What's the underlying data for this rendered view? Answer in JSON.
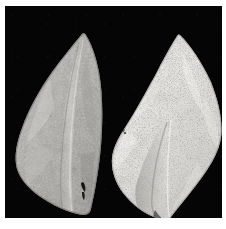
{
  "figure": {
    "kind": "photographic-plate",
    "background_color": "#050505",
    "border_color": "#ffffff",
    "plate": {
      "left": 5,
      "top": 6,
      "width": 217,
      "height": 212
    }
  },
  "artifacts": [
    {
      "id": "left-biface",
      "name": "Left biface",
      "position": "left",
      "shape": "leaf-shaped / ovate-lanceolate point",
      "orientation": "tip up, base down",
      "surface_tone": "medium gray",
      "base_color": "#a9a7a2",
      "highlight_color": "#cfcdc8",
      "shadow_color": "#6f6d6a",
      "texture": "mottled, coarse flake-scar relief with scattered dark pits",
      "tip_point": "77,38",
      "base_point": "78,210",
      "widest_point": "14,150",
      "features": [
        "longitudinal median ridge running from tip to base",
        "small dark notch near lower right margin",
        "rounded shoulder on upper left edge"
      ]
    },
    {
      "id": "right-biface",
      "name": "Right biface",
      "position": "right",
      "shape": "leaf-shaped / ovate-lanceolate point",
      "orientation": "tip up, base down",
      "surface_tone": "light, near-white",
      "base_color": "#e2e0db",
      "highlight_color": "#f4f3f0",
      "shadow_color": "#9c9a95",
      "texture": "heavily speckled with fine dark inclusions, dense stipple",
      "tip_point": "172,40",
      "base_point": "163,214",
      "widest_point": "216,130",
      "features": [
        "broad median ridge with shaded facet on the lower left",
        "dense dark mineral speckling across the whole face",
        "small dark spot near the left margin at mid height"
      ]
    }
  ],
  "colors": {
    "plate_black": "#050505",
    "frame_white": "#ffffff",
    "left_gray": "#a9a7a2",
    "right_white": "#e2e0db"
  }
}
